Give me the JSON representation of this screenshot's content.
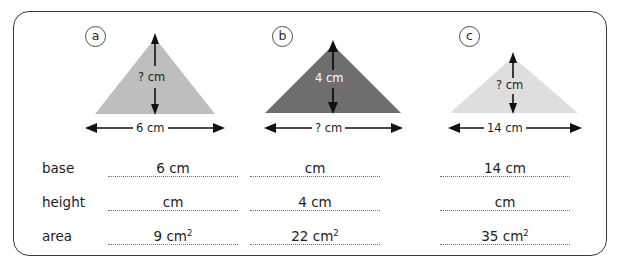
{
  "worksheet": {
    "figures": [
      {
        "tag": "a",
        "base_label": "6 cm",
        "height_label": "? cm",
        "fill": "#bebebe",
        "height_text_on_dark": false
      },
      {
        "tag": "b",
        "base_label": "? cm",
        "height_label": "4 cm",
        "fill": "#6e6e6e",
        "height_text_on_dark": true
      },
      {
        "tag": "c",
        "base_label": "14 cm",
        "height_label": "? cm",
        "fill": "#dedede",
        "height_text_on_dark": false
      }
    ],
    "table": {
      "row_labels": [
        "base",
        "height",
        "area"
      ],
      "cells": [
        [
          "6 cm",
          "",
          "14 cm"
        ],
        [
          "",
          "4 cm",
          ""
        ],
        [
          "9 cm2",
          "22 cm2",
          "35 cm2"
        ]
      ],
      "cells_display": [
        [
          "6 cm",
          "cm",
          "14 cm"
        ],
        [
          "cm",
          "4 cm",
          "cm"
        ],
        [
          "9 cm",
          "22 cm",
          "35 cm"
        ]
      ],
      "area_superscript": "2"
    },
    "colors": {
      "frame": "#3a3a3a",
      "ink": "#1d1d1d",
      "dots": "#6d6d6d"
    }
  }
}
